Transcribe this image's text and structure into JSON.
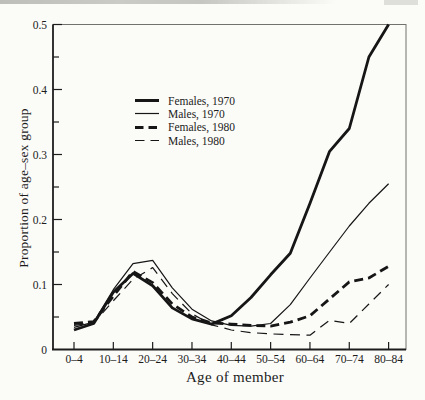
{
  "figure_type": "scanned-book-figure",
  "chart_data": {
    "type": "line",
    "title": "",
    "xlabel": "Age of member",
    "ylabel": "Proportion of age–sex group",
    "ylim": [
      0,
      0.5
    ],
    "yticks": [
      0,
      0.1,
      0.2,
      0.3,
      0.4,
      0.5
    ],
    "ytick_labels": [
      "0",
      "0.1",
      "0.2",
      "0.3",
      "0.4",
      "0.5"
    ],
    "y_minor_tick_step": 0.05,
    "grid": false,
    "legend_position": "upper-left-inside",
    "line_color": "#161616",
    "categories": [
      "0-4",
      "5-9",
      "10-14",
      "15-19",
      "20-24",
      "25-29",
      "30-34",
      "35-39",
      "40-44",
      "45-49",
      "50-54",
      "55-59",
      "60-64",
      "65-69",
      "70-74",
      "75-79",
      "80-84"
    ],
    "x_tick_labels": [
      "0–4",
      "10–14",
      "20–24",
      "30–34",
      "40–44",
      "50–54",
      "60–64",
      "70–74",
      "80–84"
    ],
    "series": [
      {
        "name": "Females, 1970",
        "line": "solid",
        "weight": "thick",
        "values": [
          0.03,
          0.04,
          0.088,
          0.117,
          0.098,
          0.064,
          0.047,
          0.039,
          0.052,
          0.08,
          0.115,
          0.148,
          0.225,
          0.305,
          0.34,
          0.45,
          0.5
        ]
      },
      {
        "name": "Males, 1970",
        "line": "solid",
        "weight": "thin",
        "values": [
          0.034,
          0.042,
          0.092,
          0.132,
          0.137,
          0.095,
          0.062,
          0.044,
          0.037,
          0.036,
          0.04,
          0.069,
          0.11,
          0.15,
          0.19,
          0.225,
          0.255
        ]
      },
      {
        "name": "Females, 1980",
        "line": "dashed",
        "weight": "thick",
        "values": [
          0.04,
          0.043,
          0.082,
          0.12,
          0.103,
          0.07,
          0.05,
          0.041,
          0.039,
          0.037,
          0.036,
          0.042,
          0.052,
          0.078,
          0.104,
          0.11,
          0.128
        ]
      },
      {
        "name": "Males, 1980",
        "line": "dashed",
        "weight": "thin",
        "values": [
          0.037,
          0.041,
          0.075,
          0.108,
          0.126,
          0.086,
          0.055,
          0.038,
          0.03,
          0.026,
          0.024,
          0.023,
          0.022,
          0.045,
          0.04,
          0.07,
          0.1
        ]
      }
    ]
  }
}
